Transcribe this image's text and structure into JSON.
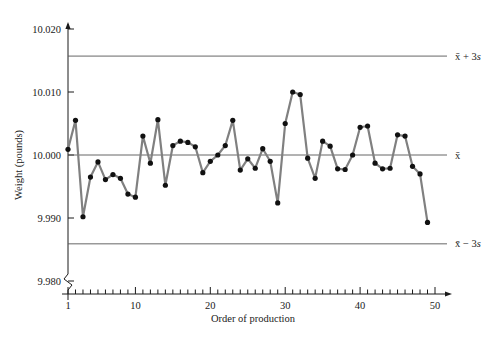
{
  "chart_data": {
    "type": "line",
    "title": "",
    "xlabel": "Order of production",
    "ylabel": "Weight (pounds)",
    "xlim": [
      1,
      50
    ],
    "ylim": [
      9.98,
      10.02
    ],
    "grid": false,
    "legend_position": "right-outside",
    "y_ticks": [
      "9.980",
      "9.990",
      "10.000",
      "10.010",
      "10.020"
    ],
    "y_tick_values": [
      9.98,
      9.99,
      10.0,
      10.01,
      10.02
    ],
    "x_ticks": [
      "1",
      "10",
      "20",
      "30",
      "40",
      "50"
    ],
    "x_tick_values": [
      1,
      10,
      20,
      30,
      40,
      50
    ],
    "x_minor_tick_step": 1,
    "y_axis_break": true,
    "series": [
      {
        "name": "Weight",
        "marker": "circle",
        "line_color": "#808080",
        "marker_color": "#111111",
        "x": [
          1,
          2,
          3,
          4,
          5,
          6,
          7,
          8,
          9,
          10,
          11,
          12,
          13,
          14,
          15,
          16,
          17,
          18,
          19,
          20,
          21,
          22,
          23,
          24,
          25,
          26,
          27,
          28,
          29,
          30,
          31,
          32,
          33,
          34,
          35,
          36,
          37,
          38,
          39,
          40,
          41,
          42,
          43,
          44,
          45,
          46,
          47,
          48,
          49
        ],
        "values": [
          10.0009,
          10.0055,
          9.9902,
          9.9965,
          9.9989,
          9.9961,
          9.9969,
          9.9963,
          9.9938,
          9.9933,
          10.003,
          9.9987,
          10.0056,
          9.9952,
          10.0015,
          10.0022,
          10.002,
          10.0013,
          9.9972,
          9.999,
          10.0,
          10.0015,
          10.0055,
          9.9976,
          9.9994,
          9.9979,
          10.001,
          9.999,
          9.9924,
          10.005,
          10.01,
          10.0096,
          9.9995,
          9.9963,
          10.0022,
          10.0014,
          9.9978,
          9.9977,
          10.0,
          10.0044,
          10.0046,
          9.9987,
          9.9978,
          9.9979,
          10.0032,
          10.003,
          9.9982,
          9.997,
          9.9893
        ]
      }
    ],
    "reference_lines": [
      {
        "id": "ucl",
        "label": "x̄ + 3s",
        "label_base": "x̄ + 3",
        "label_italic": "s",
        "value": 10.0157
      },
      {
        "id": "center",
        "label": "x̄",
        "label_base": "x̄",
        "label_italic": "",
        "value": 10.0
      },
      {
        "id": "lcl",
        "label": "x̄ − 3s",
        "label_base": "x̄ − 3",
        "label_italic": "s",
        "value": 9.9859
      }
    ]
  }
}
